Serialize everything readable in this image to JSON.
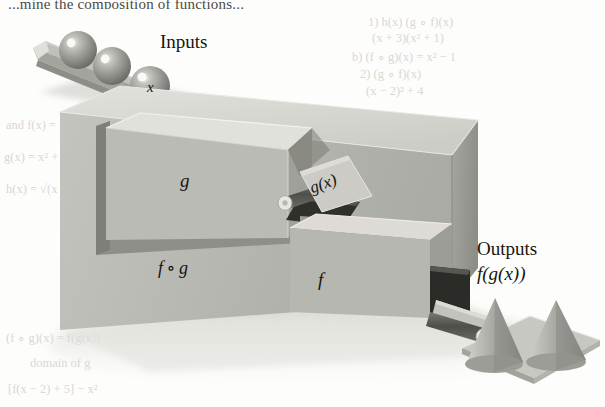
{
  "labels": {
    "inputs": "Inputs",
    "outputs": "Outputs",
    "input_value": "x",
    "inner_box": "g",
    "intermediate_value": "g(x)",
    "outer_box": "f ∘ g",
    "second_box": "f",
    "output_value": "f(g(x))"
  },
  "composition": {
    "operator": "∘",
    "left": "f",
    "right": "g"
  },
  "parts": {
    "input_chute": "input-chute",
    "spheres": [
      "sphere-1",
      "sphere-2",
      "sphere-x"
    ],
    "g_box": "g-machine-box",
    "f_box": "f-machine-box",
    "outer_housing": "fog-housing",
    "intermediate_plate": "gx-plate",
    "intermediate_hole": "gx-drop-hole",
    "output_hole": "output-opening",
    "output_ramp": "output-ramp",
    "output_tray": "output-tray",
    "cones": [
      "cone-1",
      "cone-2"
    ],
    "rollers": [
      "roller-inner",
      "roller-outer"
    ]
  },
  "bleed_text": {
    "headline": "...mine the composition of functions...",
    "right": [
      "1) h(x) (g ∘ f)(x)",
      "(x + 3)(x² + 1)",
      "b) (f ∘ g)(x) = x² − 1",
      "2) (g ∘ f)(x)",
      "(x − 2)² + 4"
    ],
    "left": [
      "and f(x) = 2x",
      "g(x) = x² + 3",
      "h(x) = √(x + 1)"
    ],
    "bottom": [
      "(f ∘ g)(x) = f(g(x))",
      "domain of g",
      "[f(x − 2) + 5] − x²"
    ]
  },
  "colors": {
    "background": "#fdfdfc",
    "box_top": "#d9d9d4",
    "box_front": "#b9b9b3",
    "box_side": "#9b9b95",
    "box_interior_front": "#a9a9a3",
    "dark_opening": "#343430",
    "sphere": "#9a9a94",
    "ink": "#16150f",
    "bleed": "#d8d8d4"
  }
}
